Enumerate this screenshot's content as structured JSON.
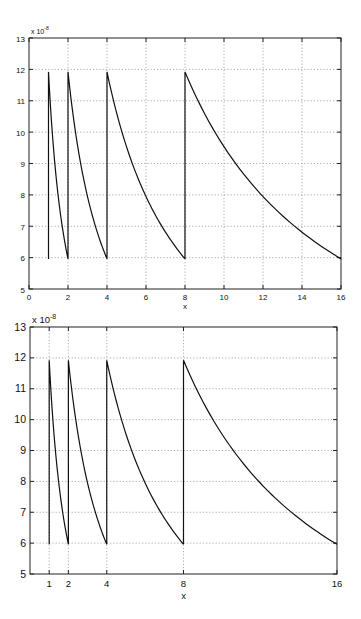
{
  "chart_data": [
    {
      "type": "line",
      "title": "",
      "xlabel": "x",
      "ylabel": "",
      "y_multiplier": "x 10^-8",
      "y_multiplier_base": "x 10",
      "y_multiplier_exp": "-8",
      "xlim": [
        0,
        16
      ],
      "ylim": [
        5,
        13
      ],
      "xticks": [
        0,
        2,
        4,
        6,
        8,
        10,
        12,
        14,
        16
      ],
      "yticks": [
        5,
        6,
        7,
        8,
        9,
        10,
        11,
        12,
        13
      ],
      "grid": true,
      "legend": null,
      "description": "Sawtooth of hyperbolic segments: y = 11.92 * 2^k / x on each interval [2^k, 2^(k+1)], with vertical jumps at x = 1, 2, 4, 8",
      "series": [
        {
          "name": "f(x)",
          "x": [
            1,
            1,
            1.25,
            1.5,
            1.75,
            2,
            2,
            2.5,
            3,
            3.5,
            4,
            4,
            5,
            6,
            7,
            8,
            8,
            9,
            10,
            11,
            12,
            13,
            14,
            15,
            16
          ],
          "y": [
            5.96,
            11.92,
            9.54,
            7.95,
            6.81,
            5.96,
            11.92,
            9.54,
            7.95,
            6.81,
            5.96,
            11.92,
            9.54,
            7.95,
            6.81,
            5.96,
            11.92,
            10.6,
            9.54,
            8.67,
            7.95,
            7.34,
            6.81,
            6.36,
            5.96
          ]
        }
      ]
    },
    {
      "type": "line",
      "title": "",
      "xlabel": "x",
      "ylabel": "",
      "y_multiplier": "x 10^-8",
      "y_multiplier_base": "x 10",
      "y_multiplier_exp": "-8",
      "xlim": [
        0,
        16
      ],
      "ylim": [
        5,
        13
      ],
      "xticks": [
        1,
        2,
        4,
        8,
        16
      ],
      "yticks": [
        5,
        6,
        7,
        8,
        9,
        10,
        11,
        12,
        13
      ],
      "grid": true,
      "legend": null,
      "description": "Same function as the upper plot, with x ticks placed only at the powers of two",
      "series": [
        {
          "name": "f(x)",
          "x": [
            1,
            1,
            1.25,
            1.5,
            1.75,
            2,
            2,
            2.5,
            3,
            3.5,
            4,
            4,
            5,
            6,
            7,
            8,
            8,
            9,
            10,
            11,
            12,
            13,
            14,
            15,
            16
          ],
          "y": [
            5.96,
            11.92,
            9.54,
            7.95,
            6.81,
            5.96,
            11.92,
            9.54,
            7.95,
            6.81,
            5.96,
            11.92,
            9.54,
            7.95,
            6.81,
            5.96,
            11.92,
            10.6,
            9.54,
            8.67,
            7.95,
            7.34,
            6.81,
            6.36,
            5.96
          ]
        }
      ]
    }
  ],
  "plots": [
    {
      "box": {
        "left": 29,
        "top": 38,
        "right": 341,
        "bottom": 289
      }
    },
    {
      "box": {
        "left": 30,
        "top": 327,
        "right": 337,
        "bottom": 574
      }
    }
  ]
}
